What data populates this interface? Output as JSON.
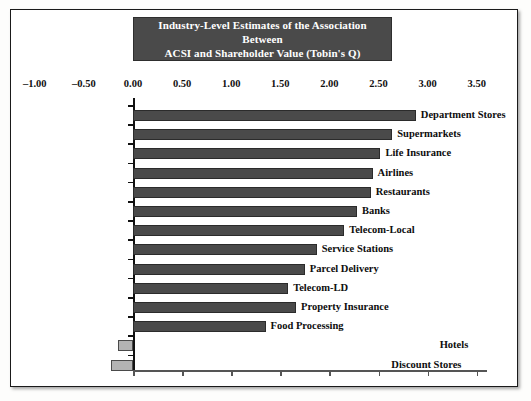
{
  "figure": {
    "title_line1": "Industry-Level Estimates of the Association Between",
    "title_line2": "ACSI and Shareholder Value (Tobin's Q)",
    "title_bg": "#4a4a4a",
    "title_color": "#ffffff",
    "bar_color": "#4a4a4a",
    "negative_bar_color": "#b3b3b3",
    "page_bg": "#ffffff"
  },
  "chart_data": {
    "type": "bar",
    "orientation": "horizontal",
    "title": "Industry-Level Estimates of the Association Between ACSI and Shareholder Value (Tobin's Q)",
    "xlabel": "",
    "ylabel": "",
    "xlim": [
      -1.0,
      3.5
    ],
    "xticks": [
      "-1.00",
      "-0.50",
      "0.00",
      "0.50",
      "1.00",
      "1.50",
      "2.00",
      "2.50",
      "3.00",
      "3.50"
    ],
    "xtick_values": [
      -1.0,
      -0.5,
      0.0,
      0.5,
      1.0,
      1.5,
      2.0,
      2.5,
      3.0,
      3.5
    ],
    "grid": false,
    "legend": "none",
    "categories": [
      "Department Stores",
      "Supermarkets",
      "Life Insurance",
      "Airlines",
      "Restaurants",
      "Banks",
      "Telecom-Local",
      "Service Stations",
      "Parcel Delivery",
      "Telecom-LD",
      "Property Insurance",
      "Food Processing",
      "Hotels",
      "Discount Stores"
    ],
    "values": [
      2.88,
      2.64,
      2.52,
      2.44,
      2.42,
      2.28,
      2.15,
      1.87,
      1.75,
      1.58,
      1.66,
      1.35,
      -0.15,
      -0.22
    ]
  }
}
